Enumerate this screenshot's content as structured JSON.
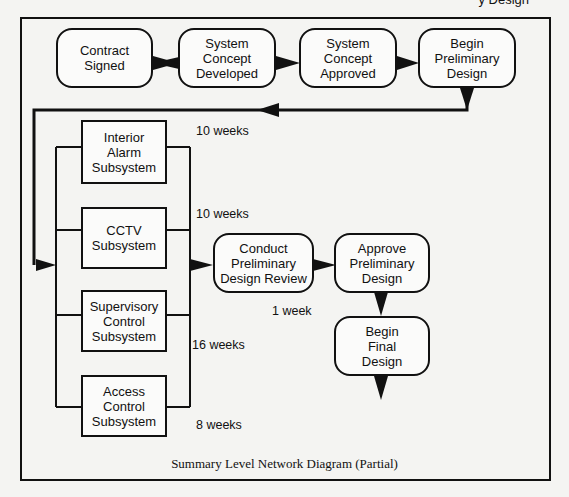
{
  "header": {
    "partial_text": "y Design"
  },
  "top_row": [
    {
      "id": "contract-signed",
      "label": "Contract\nSigned"
    },
    {
      "id": "system-concept-developed",
      "label": "System\nConcept\nDeveloped"
    },
    {
      "id": "system-concept-approved",
      "label": "System\nConcept\nApproved"
    },
    {
      "id": "begin-preliminary-design",
      "label": "Begin\nPreliminary\nDesign"
    }
  ],
  "subsystems": [
    {
      "id": "interior-alarm",
      "label": "Interior\nAlarm\nSubsystem",
      "duration": "10 weeks"
    },
    {
      "id": "cctv",
      "label": "CCTV\nSubsystem",
      "duration": "10 weeks"
    },
    {
      "id": "supervisory-control",
      "label": "Supervisory\nControl\nSubsystem",
      "duration": "16 weeks"
    },
    {
      "id": "access-control",
      "label": "Access\nControl\nSubsystem",
      "duration": "8 weeks"
    }
  ],
  "review": {
    "conduct": {
      "label": "Conduct\nPreliminary\nDesign Review",
      "duration": "1 week"
    },
    "approve": {
      "label": "Approve\nPreliminary\nDesign"
    },
    "final": {
      "label": "Begin\nFinal\nDesign"
    }
  },
  "caption": "Summary Level Network Diagram (Partial)"
}
